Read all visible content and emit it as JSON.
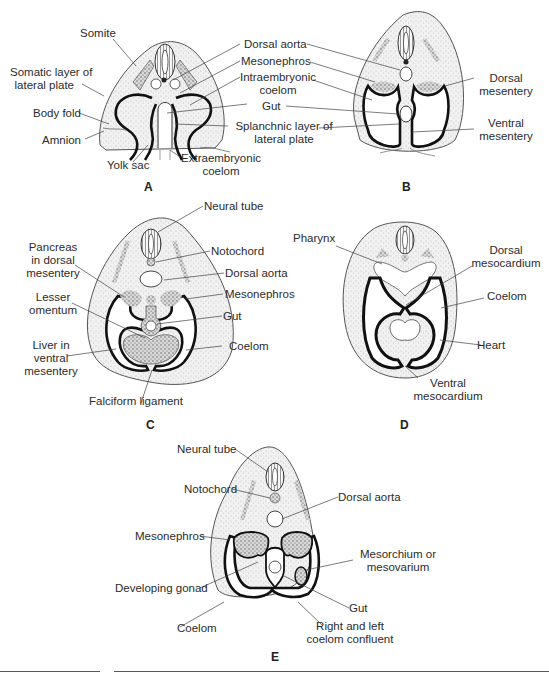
{
  "figure": {
    "panels": [
      {
        "id": "A",
        "letter": "A",
        "labels": {
          "somite": "Somite",
          "somatic_1": "Somatic layer of",
          "somatic_2": "lateral plate",
          "body_fold": "Body fold",
          "amnion": "Amnion",
          "yolk_sac": "Yolk sac",
          "extra_1": "Extraembryonic",
          "extra_2": "coelom",
          "dorsal_aorta": "Dorsal aorta",
          "mesonephros": "Mesonephros",
          "intra_1": "Intraembryonic",
          "intra_2": "coelom",
          "gut": "Gut",
          "splanch_1": "Splanchnic layer of",
          "splanch_2": "lateral plate"
        }
      },
      {
        "id": "B",
        "letter": "B",
        "labels": {
          "dorsal_mes_1": "Dorsal",
          "dorsal_mes_2": "mesentery",
          "ventral_mes_1": "Ventral",
          "ventral_mes_2": "mesentery"
        }
      },
      {
        "id": "C",
        "letter": "C",
        "labels": {
          "neural_tube": "Neural tube",
          "notochord": "Notochord",
          "dorsal_aorta": "Dorsal aorta",
          "mesonephros": "Mesonephros",
          "gut": "Gut",
          "coelom": "Coelom",
          "pancreas_1": "Pancreas",
          "pancreas_2": "in dorsal",
          "pancreas_3": "mesentery",
          "lesser_1": "Lesser",
          "lesser_2": "omentum",
          "liver_1": "Liver in",
          "liver_2": "ventral",
          "liver_3": "mesentery",
          "falciform": "Falciform ligament"
        }
      },
      {
        "id": "D",
        "letter": "D",
        "labels": {
          "pharynx": "Pharynx",
          "dorsal_meso_1": "Dorsal",
          "dorsal_meso_2": "mesocardium",
          "coelom": "Coelom",
          "heart": "Heart",
          "ventral_meso_1": "Ventral",
          "ventral_meso_2": "mesocardium"
        }
      },
      {
        "id": "E",
        "letter": "E",
        "labels": {
          "neural_tube": "Neural tube",
          "notochord": "Notochord",
          "dorsal_aorta": "Dorsal aorta",
          "mesonephros": "Mesonephros",
          "mesorchium_1": "Mesorchium or",
          "mesorchium_2": "mesovarium",
          "gonad": "Developing gonad",
          "gut": "Gut",
          "coelom": "Coelom",
          "confluent_1": "Right and left",
          "confluent_2": "coelom confluent"
        }
      }
    ]
  },
  "colors": {
    "line": "#111111",
    "tissue_fill": "#ececec",
    "stipple": "#8a8a8a",
    "label_text": "#2b2b2b"
  }
}
